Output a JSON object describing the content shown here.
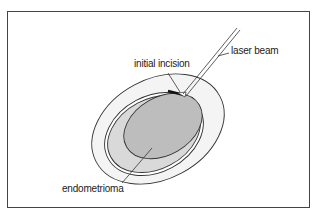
{
  "figure": {
    "labels": {
      "laser_beam": "laser beam",
      "initial_incision": "initial incision",
      "endometrioma": "endometrioma"
    },
    "colors": {
      "outer_capsule": "#f4f4f4",
      "ovarian_tissue": "#d9d9d9",
      "endometrioma": "#bdbdbd",
      "outline": "#333333"
    }
  }
}
